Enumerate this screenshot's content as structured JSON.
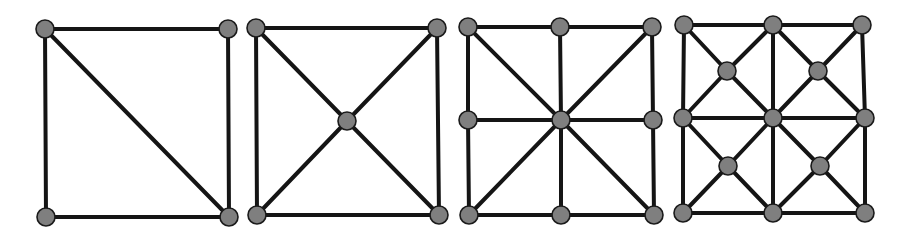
{
  "figure": {
    "colors": {
      "edge": "#151515",
      "node_fill": "#7f7f7f",
      "node_stroke": "#1a1a1a",
      "background": "#ffffff"
    },
    "node_radius": 9,
    "panels": [
      {
        "id": "mesh-1",
        "nodes": [
          [
            45,
            29
          ],
          [
            228,
            29
          ],
          [
            46,
            217
          ],
          [
            229,
            217
          ]
        ],
        "edges": [
          [
            0,
            1
          ],
          [
            0,
            2
          ],
          [
            1,
            3
          ],
          [
            2,
            3
          ],
          [
            0,
            3
          ]
        ]
      },
      {
        "id": "mesh-2",
        "nodes": [
          [
            256,
            28
          ],
          [
            437,
            28
          ],
          [
            347,
            121
          ],
          [
            257,
            215
          ],
          [
            439,
            215
          ]
        ],
        "edges": [
          [
            0,
            1
          ],
          [
            0,
            3
          ],
          [
            1,
            4
          ],
          [
            3,
            4
          ],
          [
            0,
            2
          ],
          [
            1,
            2
          ],
          [
            2,
            3
          ],
          [
            2,
            4
          ]
        ]
      },
      {
        "id": "mesh-3",
        "nodes": [
          [
            468,
            27
          ],
          [
            560,
            27
          ],
          [
            652,
            27
          ],
          [
            468,
            120
          ],
          [
            561,
            120
          ],
          [
            653,
            120
          ],
          [
            469,
            215
          ],
          [
            561,
            215
          ],
          [
            654,
            215
          ]
        ],
        "edges": [
          [
            0,
            1
          ],
          [
            1,
            2
          ],
          [
            3,
            4
          ],
          [
            4,
            5
          ],
          [
            6,
            7
          ],
          [
            7,
            8
          ],
          [
            0,
            3
          ],
          [
            3,
            6
          ],
          [
            1,
            4
          ],
          [
            4,
            7
          ],
          [
            2,
            5
          ],
          [
            5,
            8
          ],
          [
            0,
            4
          ],
          [
            2,
            4
          ],
          [
            6,
            4
          ],
          [
            8,
            4
          ]
        ]
      },
      {
        "id": "mesh-4",
        "nodes": [
          [
            684,
            25
          ],
          [
            773,
            25
          ],
          [
            862,
            25
          ],
          [
            727,
            71
          ],
          [
            818,
            71
          ],
          [
            683,
            118
          ],
          [
            773,
            118
          ],
          [
            865,
            118
          ],
          [
            728,
            166
          ],
          [
            820,
            166
          ],
          [
            683,
            213
          ],
          [
            773,
            213
          ],
          [
            865,
            213
          ]
        ],
        "edges": [
          [
            0,
            1
          ],
          [
            1,
            2
          ],
          [
            5,
            6
          ],
          [
            6,
            7
          ],
          [
            10,
            11
          ],
          [
            11,
            12
          ],
          [
            0,
            5
          ],
          [
            5,
            10
          ],
          [
            1,
            6
          ],
          [
            6,
            11
          ],
          [
            2,
            7
          ],
          [
            7,
            12
          ],
          [
            0,
            3
          ],
          [
            1,
            3
          ],
          [
            5,
            3
          ],
          [
            6,
            3
          ],
          [
            1,
            4
          ],
          [
            2,
            4
          ],
          [
            6,
            4
          ],
          [
            7,
            4
          ],
          [
            5,
            8
          ],
          [
            6,
            8
          ],
          [
            10,
            8
          ],
          [
            11,
            8
          ],
          [
            6,
            9
          ],
          [
            7,
            9
          ],
          [
            11,
            9
          ],
          [
            12,
            9
          ]
        ]
      }
    ]
  }
}
